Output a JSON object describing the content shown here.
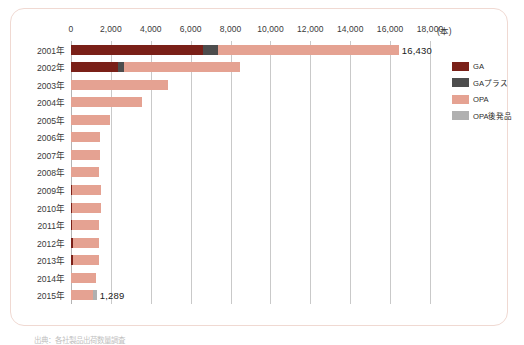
{
  "chart_data": {
    "type": "bar",
    "orientation": "horizontal",
    "stacked": true,
    "title": "",
    "xlabel": "(本)",
    "ylabel": "",
    "xlim": [
      0,
      18000
    ],
    "xticks": [
      0,
      2000,
      4000,
      6000,
      8000,
      10000,
      12000,
      14000,
      16000,
      18000
    ],
    "xtick_labels": [
      "0",
      "2,000",
      "4,000",
      "6,000",
      "8,000",
      "10,000",
      "12,000",
      "14,000",
      "16,000",
      "18,000"
    ],
    "unit_label": "(本)",
    "grid": true,
    "legend_position": "right",
    "categories": [
      "2001年",
      "2002年",
      "2003年",
      "2004年",
      "2005年",
      "2006年",
      "2007年",
      "2008年",
      "2009年",
      "2010年",
      "2011年",
      "2012年",
      "2013年",
      "2014年",
      "2015年"
    ],
    "series": [
      {
        "name": "GA",
        "color": "#7a2018",
        "values": [
          6600,
          2350,
          0,
          0,
          0,
          0,
          0,
          0,
          60,
          70,
          60,
          90,
          90,
          0,
          0
        ]
      },
      {
        "name": "GAプラス",
        "color": "#4d4d4d",
        "values": [
          750,
          300,
          0,
          0,
          0,
          0,
          0,
          0,
          0,
          0,
          0,
          0,
          0,
          0,
          0
        ]
      },
      {
        "name": "OPA",
        "color": "#e5a292",
        "values": [
          9080,
          5800,
          4870,
          3580,
          1960,
          1470,
          1440,
          1400,
          1440,
          1450,
          1330,
          1300,
          1330,
          1240,
          1120
        ]
      },
      {
        "name": "OPA後発品",
        "color": "#b0b0b0",
        "values": [
          0,
          0,
          0,
          0,
          0,
          0,
          0,
          0,
          0,
          0,
          0,
          0,
          0,
          0,
          169
        ]
      }
    ],
    "totals": [
      16430,
      8450,
      4870,
      3580,
      1960,
      1470,
      1440,
      1400,
      1500,
      1520,
      1390,
      1390,
      1420,
      1240,
      1289
    ],
    "point_labels": {
      "2001年": "16,430",
      "2015年": "1,289"
    }
  },
  "legend": {
    "items": [
      {
        "label": "GA",
        "color_key": "ga"
      },
      {
        "label": "GAプラス",
        "color_key": "gap"
      },
      {
        "label": "OPA",
        "color_key": "opa"
      },
      {
        "label": "OPA後発品",
        "color_key": "opag"
      }
    ]
  },
  "footnote": {
    "text": "出典：各社製品出荷数量調査"
  },
  "colors": {
    "ga": "#7a2018",
    "ga_plus": "#4d4d4d",
    "opa": "#e5a292",
    "opa_generic": "#b0b0b0",
    "card_border": "#f0d9d2",
    "gridline": "#c9c9c9",
    "text": "#3a3a3a"
  }
}
